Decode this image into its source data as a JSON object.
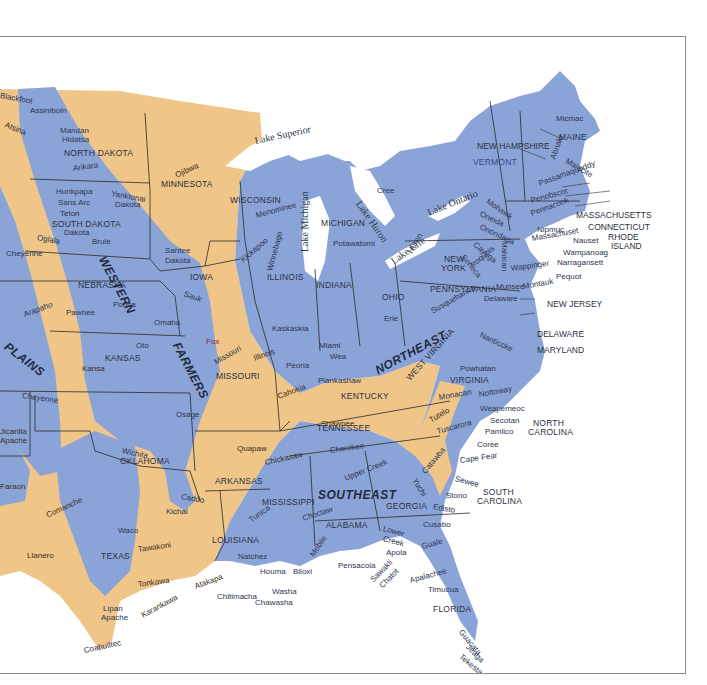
{
  "map": {
    "title": "Native American culture areas of the eastern United States",
    "colors": {
      "blue_zone": "#8ba4d8",
      "tan_zone": "#f0c588",
      "water": "#ffffff",
      "border": "#2b2b2b",
      "frame": "#8a8a8a"
    },
    "regions": {
      "western": "WESTERN",
      "plains": "PLAINS",
      "farmers": "FARMERS",
      "northeast": "NORTHEAST",
      "southeast": "SOUTHEAST"
    },
    "lakes": {
      "superior": "Lake Superior",
      "michigan": "Lake Michigan",
      "huron": "Lake Huron",
      "erie": "Lake Erie",
      "ontario": "Lake Ontario"
    },
    "states": {
      "north_dakota": "NORTH DAKOTA",
      "south_dakota": "SOUTH DAKOTA",
      "minnesota": "MINNESOTA",
      "wisconsin": "WISCONSIN",
      "michigan": "MICHIGAN",
      "iowa": "IOWA",
      "nebraska": "NEBRASKA",
      "kansas": "KANSAS",
      "missouri": "MISSOURI",
      "illinois": "ILLINOIS",
      "indiana": "INDIANA",
      "ohio": "OHIO",
      "kentucky": "KENTUCKY",
      "tennessee": "TENNESSEE",
      "oklahoma": "OKLAHOMA",
      "arkansas": "ARKANSAS",
      "texas": "TEXAS",
      "louisiana": "LOUISIANA",
      "mississippi": "MISSISSIPPI",
      "alabama": "ALABAMA",
      "georgia": "GEORGIA",
      "florida": "FLORIDA",
      "south_carolina_1": "SOUTH",
      "south_carolina_2": "CAROLINA",
      "north_carolina_1": "NORTH",
      "north_carolina_2": "CAROLINA",
      "virginia": "VIRGINIA",
      "west_virginia": "WEST VIRGINIA",
      "pennsylvania": "PENNSYLVANIA",
      "new_york_1": "NEW",
      "new_york_2": "YORK",
      "new_jersey": "NEW JERSEY",
      "delaware": "DELAWARE",
      "maryland": "MARYLAND",
      "vermont": "VERMONT",
      "new_hampshire": "NEW HAMPSHIRE",
      "maine": "MAINE",
      "massachusetts": "MASSACHUSETTS",
      "connecticut": "CONNECTICUT",
      "rhode_island_1": "RHODE",
      "rhode_island_2": "ISLAND"
    },
    "tribes": {
      "blackfoot": "Blackfoot",
      "assiniboin": "Assiniboin",
      "atsina": "Atsina",
      "mandan": "Mandan",
      "hidatsa": "Hidatsa",
      "arikara": "Arikara",
      "hunkpapa": "Hunkpapa",
      "sans_arc": "Sans Arc",
      "teton": "Teton",
      "dakota": "Dakota",
      "oglala": "Oglala",
      "brule": "Brule",
      "yanktonai": "Yanktonai",
      "yanktonai_dakota": "Dakota",
      "santee": "Santee",
      "santee_dakota": "Dakota",
      "ojibwa": "Ojibwa",
      "menominee": "Menominee",
      "kickapoo": "Kickapoo",
      "winnebago": "Winnebago",
      "potawatomi": "Potawatomi",
      "cree": "Cree",
      "huron": "Huron",
      "cheyenne_1": "Cheyenne",
      "arapaho": "Arapaho",
      "cheyenne_2": "Cheyenne",
      "pawnee": "Pawnee",
      "ponca": "Ponca",
      "omaha": "Omaha",
      "oto": "Oto",
      "sauk": "Sauk",
      "fox": "Fox",
      "kansa": "Kansa",
      "osage": "Osage",
      "missouri": "Missouri",
      "illinois": "Illinois",
      "kaskaskia": "Kaskaskia",
      "peoria": "Peoria",
      "cahokia": "Cahokia",
      "miami": "Miami",
      "wea": "Wea",
      "piankashaw": "Piankashaw",
      "erie": "Erie",
      "shawnee": "Shawnee",
      "jicarilla": "Jicarilla",
      "jicarilla_apache": "Apache",
      "faraon": "Faraon",
      "wichita": "Wichita",
      "caddo": "Caddo",
      "kichai": "Kichai",
      "quapaw": "Quapaw",
      "comanche": "Comanche",
      "llanero": "Llanero",
      "waco": "Waco",
      "tawakoni": "Tawakoni",
      "tonkawa": "Tonkawa",
      "lipan": "Lipan",
      "lipan_apache": "Apache",
      "karankawa": "Karankawa",
      "coahuiltec": "Coahuiltec",
      "atakapa": "Atakapa",
      "chitimacha": "Chitimacha",
      "chickasaw": "Chickasaw",
      "cherokee": "Cherokee",
      "upper_creek": "Upper Creek",
      "choctaw": "Choctaw",
      "tunica": "Tunica",
      "natchez": "Natchez",
      "houma": "Houma",
      "biloxi": "Biloxi",
      "washa": "Washa",
      "chawasha": "Chawasha",
      "mobile": "Mobile",
      "pensacola": "Pensacola",
      "lower_creek_1": "Lower",
      "lower_creek_2": "Creek",
      "apalachicola": "Apola",
      "sawakli": "Sawakli",
      "chatot": "Chatot",
      "apalachee": "Apalachee",
      "timucua": "Timucua",
      "guacata": "Guacata",
      "jeaga": "Jeaga",
      "tekesta": "Tekesta",
      "cusabo": "Cusabo",
      "guale": "Guale",
      "edisto": "Edisto",
      "stono": "Stono",
      "sewee": "Sewee",
      "yuchi": "Yuchi",
      "catawba": "Catawba",
      "cape_fear": "Cape Fear",
      "coree": "Coree",
      "pamlico": "Pamlico",
      "secotan": "Secotan",
      "weapemeoc": "Weapemeoc",
      "tuscarora": "Tuscarora",
      "tutelo": "Tutelo",
      "nottoway": "Nottoway",
      "monacan": "Monacan",
      "powhatan": "Powhatan",
      "nanticoke": "Nanticoke",
      "susquehanna": "Susquehanna",
      "delaware": "Delaware",
      "munsee": "Munsee",
      "montauk": "Montauk",
      "pequot": "Pequot",
      "narragansett": "Narragansett",
      "wampanoag": "Wampanoag",
      "nauset": "Nauset",
      "massachuset": "Massachuset",
      "nipmuc": "Nipmuc",
      "wappinger": "Wappinger",
      "mahican": "Mahican",
      "iroquois": "Iroquois",
      "seneca": "Seneca",
      "cayuga": "Cayuga",
      "onondaga": "Onondaga",
      "oneida": "Oneida",
      "mohawk": "Mohawk",
      "pennacook": "Pennacook",
      "penobscot": "Penobscot",
      "passamaquoddy": "Passamaquoddy",
      "abnaki": "Abnaki",
      "malecite": "Malecite",
      "micmac": "Micmac"
    }
  }
}
